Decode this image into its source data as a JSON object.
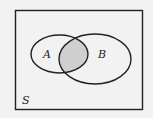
{
  "diagram": {
    "type": "venn",
    "universe_label": "S",
    "sets": [
      {
        "label": "A"
      },
      {
        "label": "B"
      }
    ],
    "shaded_region": "A ∩ B",
    "colors": {
      "background": "#f2f2f2",
      "stroke": "#222222",
      "shade": "#cfcfcf"
    }
  }
}
